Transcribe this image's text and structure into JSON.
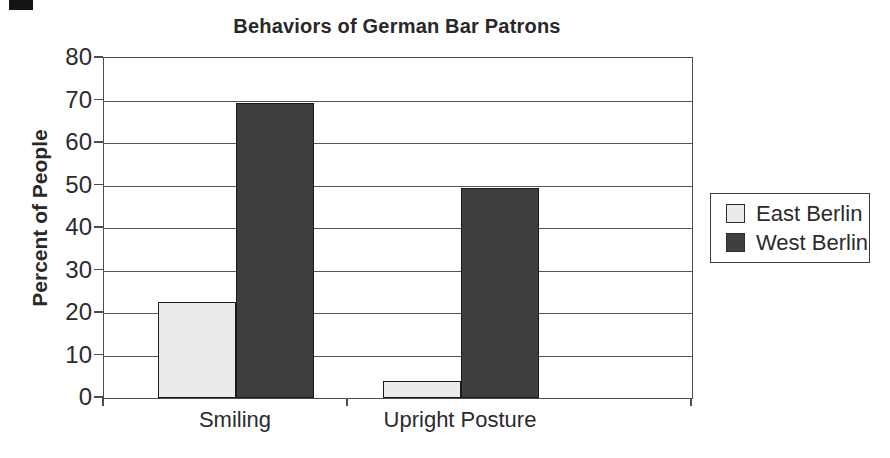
{
  "chart_data": {
    "type": "bar",
    "title": "Behaviors of German Bar Patrons",
    "xlabel": "",
    "ylabel": "Percent of People",
    "categories": [
      "Smiling",
      "Upright Posture"
    ],
    "series": [
      {
        "name": "East Berlin",
        "values": [
          22.5,
          4
        ],
        "color": "#ebebeb"
      },
      {
        "name": "West Berlin",
        "values": [
          69.5,
          49.5
        ],
        "color": "#3f3f3f"
      }
    ],
    "ylim": [
      0,
      80
    ],
    "yticks": [
      0,
      10,
      20,
      30,
      40,
      50,
      60,
      70,
      80
    ],
    "grid": "horizontal",
    "legend_position": "right",
    "colors": {
      "axis_line": "#4d4d4d",
      "text": "#2b2b2b",
      "background": "#ffffff"
    }
  },
  "artifacts": {
    "scan_mark_top_left": ""
  }
}
